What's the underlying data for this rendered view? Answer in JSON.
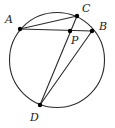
{
  "figure": {
    "kind": "circle-geometry-diagram",
    "width": 115,
    "height": 128,
    "background_color": "#ffffff",
    "stroke_color": "#2b2b2b",
    "label_color": "#1a1a1a",
    "point_color": "#000000"
  },
  "circle": {
    "name": "circumscribed-circle",
    "center_x": 57,
    "center_y": 60,
    "radius": 48,
    "stroke_width": 1.1
  },
  "points": [
    {
      "id": "A",
      "label": "A",
      "x": 20,
      "y": 29,
      "label_x": 5,
      "label_y": 14,
      "on_circle": true
    },
    {
      "id": "C",
      "label": "C",
      "x": 77,
      "y": 16,
      "label_x": 82,
      "label_y": 3,
      "on_circle": true
    },
    {
      "id": "B",
      "label": "B",
      "x": 92,
      "y": 31,
      "label_x": 99,
      "label_y": 21,
      "on_circle": true
    },
    {
      "id": "P",
      "label": "P",
      "x": 70,
      "y": 31,
      "label_x": 71,
      "label_y": 35,
      "on_circle": false
    },
    {
      "id": "D",
      "label": "D",
      "x": 40,
      "y": 105,
      "label_x": 30,
      "label_y": 112,
      "on_circle": true
    }
  ],
  "chords": [
    {
      "id": "AC",
      "from": "A",
      "to": "C",
      "x1": 20,
      "y1": 29,
      "x2": 77,
      "y2": 16
    },
    {
      "id": "AB",
      "from": "A",
      "to": "B",
      "x1": 20,
      "y1": 29,
      "x2": 92,
      "y2": 31
    },
    {
      "id": "CD",
      "from": "C",
      "to": "D",
      "x1": 77,
      "y1": 16,
      "x2": 40,
      "y2": 105
    },
    {
      "id": "BD",
      "from": "B",
      "to": "D",
      "x1": 92,
      "y1": 31,
      "x2": 40,
      "y2": 105
    }
  ],
  "intersection": {
    "id": "P",
    "label": "P",
    "of_chords": "AB x CD",
    "x": 70,
    "y": 31
  }
}
